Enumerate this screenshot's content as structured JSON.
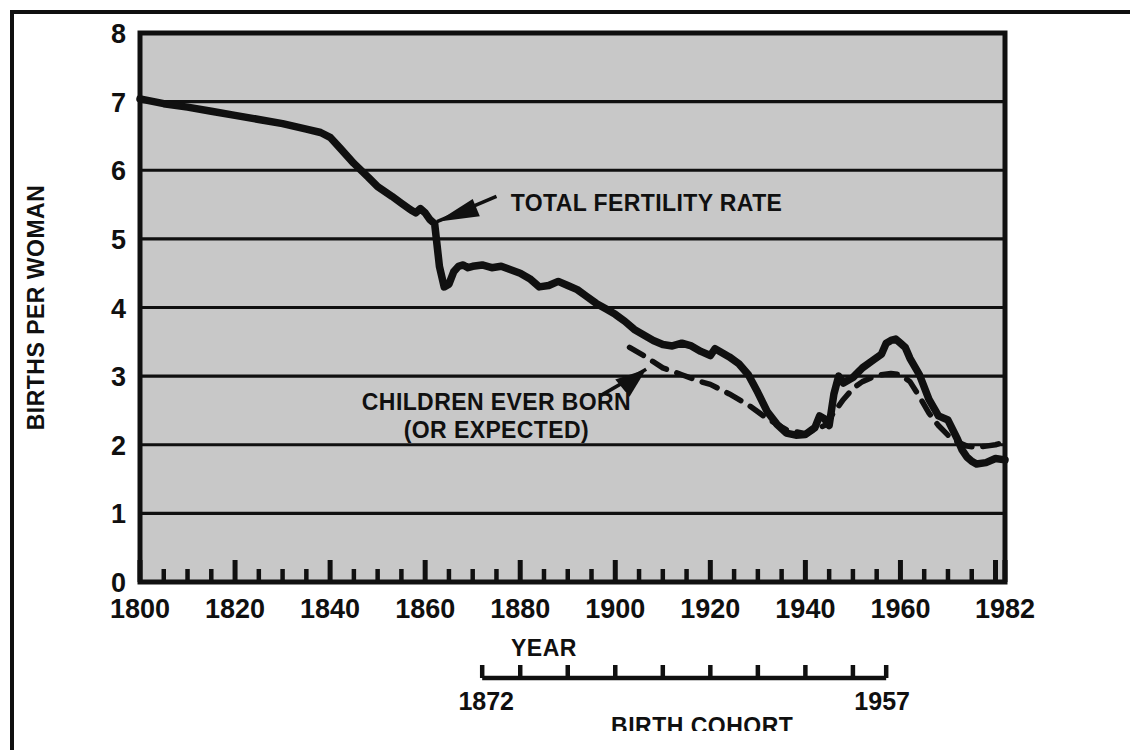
{
  "chart_data": {
    "type": "line",
    "title": "",
    "xlabel": "YEAR",
    "ylabel": "BIRTHS PER WOMAN",
    "secondary_xlabel": "BIRTH COHORT",
    "xlim": [
      1800,
      1982
    ],
    "ylim": [
      0,
      8
    ],
    "grid": true,
    "legend": "none (inline annotations with arrows)",
    "ytick_labels": [
      "0",
      "1",
      "2",
      "3",
      "4",
      "5",
      "6",
      "7",
      "8"
    ],
    "ytick_values": [
      0,
      1,
      2,
      3,
      4,
      5,
      6,
      7,
      8
    ],
    "xtick_labels": [
      "1800",
      "1820",
      "1840",
      "1860",
      "1880",
      "1900",
      "1920",
      "1940",
      "1960",
      "1982"
    ],
    "xtick_values": [
      1800,
      1820,
      1840,
      1860,
      1880,
      1900,
      1920,
      1940,
      1960,
      1982
    ],
    "xminor_step": 5,
    "secondary_axis": {
      "start_label": "1872",
      "end_label": "1957",
      "start_value": 1872,
      "end_value": 1957,
      "tick_step": 10
    },
    "annotations": [
      {
        "name": "total-fertility-rate",
        "lines": [
          "TOTAL FERTILITY RATE"
        ],
        "points_to": {
          "x": 1861,
          "y": 5.25
        }
      },
      {
        "name": "children-ever-born",
        "lines": [
          "CHILDREN EVER BORN",
          "(OR EXPECTED)"
        ],
        "points_to": {
          "x": 1907,
          "y": 3.1
        }
      }
    ],
    "series": [
      {
        "name": "TOTAL FERTILITY RATE",
        "style": "solid",
        "color": "#101010",
        "points": [
          [
            1800,
            7.04
          ],
          [
            1805,
            6.97
          ],
          [
            1810,
            6.92
          ],
          [
            1815,
            6.86
          ],
          [
            1820,
            6.8
          ],
          [
            1825,
            6.74
          ],
          [
            1830,
            6.68
          ],
          [
            1835,
            6.6
          ],
          [
            1838,
            6.55
          ],
          [
            1840,
            6.48
          ],
          [
            1842,
            6.33
          ],
          [
            1845,
            6.1
          ],
          [
            1848,
            5.9
          ],
          [
            1850,
            5.76
          ],
          [
            1853,
            5.62
          ],
          [
            1855,
            5.52
          ],
          [
            1857,
            5.42
          ],
          [
            1858,
            5.38
          ],
          [
            1859,
            5.44
          ],
          [
            1860,
            5.38
          ],
          [
            1861,
            5.28
          ],
          [
            1862,
            5.22
          ],
          [
            1863,
            4.6
          ],
          [
            1864,
            4.3
          ],
          [
            1865,
            4.34
          ],
          [
            1866,
            4.52
          ],
          [
            1867,
            4.6
          ],
          [
            1868,
            4.62
          ],
          [
            1869,
            4.58
          ],
          [
            1870,
            4.6
          ],
          [
            1872,
            4.62
          ],
          [
            1874,
            4.58
          ],
          [
            1876,
            4.6
          ],
          [
            1878,
            4.55
          ],
          [
            1880,
            4.5
          ],
          [
            1882,
            4.42
          ],
          [
            1884,
            4.3
          ],
          [
            1886,
            4.32
          ],
          [
            1888,
            4.38
          ],
          [
            1890,
            4.32
          ],
          [
            1892,
            4.26
          ],
          [
            1894,
            4.16
          ],
          [
            1896,
            4.06
          ],
          [
            1898,
            3.98
          ],
          [
            1900,
            3.9
          ],
          [
            1902,
            3.8
          ],
          [
            1904,
            3.68
          ],
          [
            1906,
            3.6
          ],
          [
            1908,
            3.52
          ],
          [
            1910,
            3.46
          ],
          [
            1912,
            3.44
          ],
          [
            1914,
            3.48
          ],
          [
            1916,
            3.44
          ],
          [
            1918,
            3.36
          ],
          [
            1920,
            3.3
          ],
          [
            1921,
            3.4
          ],
          [
            1922,
            3.36
          ],
          [
            1924,
            3.28
          ],
          [
            1926,
            3.18
          ],
          [
            1928,
            3.02
          ],
          [
            1930,
            2.76
          ],
          [
            1932,
            2.48
          ],
          [
            1934,
            2.3
          ],
          [
            1936,
            2.17
          ],
          [
            1938,
            2.14
          ],
          [
            1940,
            2.15
          ],
          [
            1942,
            2.25
          ],
          [
            1943,
            2.42
          ],
          [
            1944,
            2.38
          ],
          [
            1945,
            2.28
          ],
          [
            1946,
            2.74
          ],
          [
            1947,
            3.0
          ],
          [
            1948,
            2.9
          ],
          [
            1949,
            2.94
          ],
          [
            1950,
            2.98
          ],
          [
            1952,
            3.12
          ],
          [
            1954,
            3.22
          ],
          [
            1956,
            3.32
          ],
          [
            1957,
            3.48
          ],
          [
            1958,
            3.52
          ],
          [
            1959,
            3.54
          ],
          [
            1960,
            3.48
          ],
          [
            1961,
            3.42
          ],
          [
            1962,
            3.26
          ],
          [
            1964,
            3.02
          ],
          [
            1966,
            2.66
          ],
          [
            1968,
            2.42
          ],
          [
            1970,
            2.36
          ],
          [
            1972,
            2.08
          ],
          [
            1973,
            1.92
          ],
          [
            1974,
            1.82
          ],
          [
            1975,
            1.76
          ],
          [
            1976,
            1.72
          ],
          [
            1978,
            1.74
          ],
          [
            1980,
            1.8
          ],
          [
            1982,
            1.78
          ]
        ]
      },
      {
        "name": "CHILDREN EVER BORN (OR EXPECTED)",
        "style": "dashed",
        "color": "#101010",
        "points": [
          [
            1903,
            3.42
          ],
          [
            1906,
            3.3
          ],
          [
            1910,
            3.12
          ],
          [
            1914,
            3.02
          ],
          [
            1918,
            2.92
          ],
          [
            1920,
            2.88
          ],
          [
            1924,
            2.74
          ],
          [
            1928,
            2.58
          ],
          [
            1932,
            2.38
          ],
          [
            1936,
            2.22
          ],
          [
            1940,
            2.16
          ],
          [
            1944,
            2.28
          ],
          [
            1948,
            2.66
          ],
          [
            1950,
            2.82
          ],
          [
            1952,
            2.92
          ],
          [
            1954,
            2.98
          ],
          [
            1956,
            3.02
          ],
          [
            1958,
            3.04
          ],
          [
            1960,
            3.02
          ],
          [
            1962,
            2.92
          ],
          [
            1964,
            2.7
          ],
          [
            1966,
            2.46
          ],
          [
            1968,
            2.28
          ],
          [
            1970,
            2.14
          ],
          [
            1972,
            2.04
          ],
          [
            1974,
            1.98
          ],
          [
            1976,
            1.96
          ],
          [
            1978,
            1.98
          ],
          [
            1980,
            2.0
          ],
          [
            1982,
            2.04
          ]
        ]
      }
    ]
  },
  "labels": {
    "ylabel": "BIRTHS PER WOMAN",
    "xlabel": "YEAR",
    "cohort_label": "BIRTH COHORT",
    "cohort_start": "1872",
    "cohort_end": "1957",
    "anno_tfr": "TOTAL FERTILITY RATE",
    "anno_ceb_line1": "CHILDREN EVER BORN",
    "anno_ceb_line2": "(OR EXPECTED)"
  },
  "colors": {
    "plot_fill": "#c8c8c8",
    "ink": "#101010",
    "page": "#ffffff"
  }
}
